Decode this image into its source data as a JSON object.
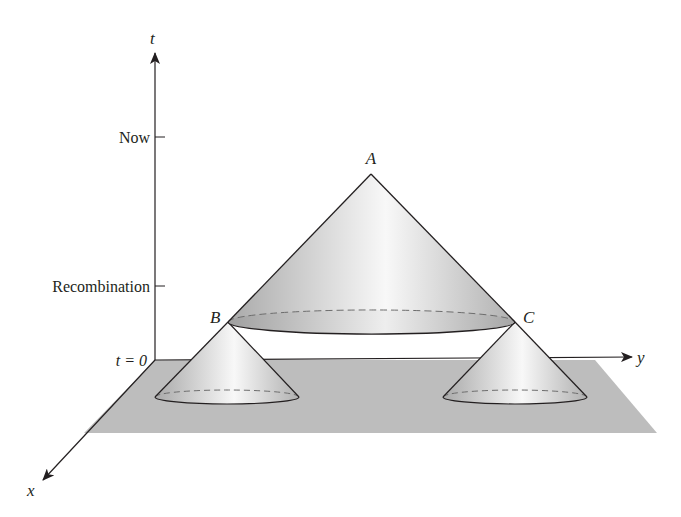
{
  "figure": {
    "axes": {
      "t_label": "t",
      "y_label": "y",
      "x_label": "x"
    },
    "ticks": {
      "now": "Now",
      "recombination": "Recombination",
      "t0": "t = 0"
    },
    "points": {
      "A": "A",
      "B": "B",
      "C": "C"
    },
    "colors": {
      "plane": "#b9b9b9",
      "cone_dark": "#b4b4b4",
      "cone_light": "#f6f6f6",
      "line": "#231f20",
      "dashed": "#6d6d6d"
    }
  }
}
